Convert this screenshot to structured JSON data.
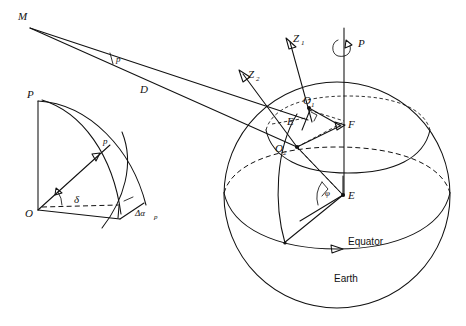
{
  "figure": {
    "background_color": "#ffffff",
    "ink_color": "#111111",
    "width": 466,
    "height": 326
  },
  "labels": {
    "celestial_body": "M",
    "parallax_angle": "p",
    "distance": "D",
    "zenith_1": "Z",
    "zenith_1_sub": "1",
    "zenith_2": "Z",
    "zenith_2_sub": "2",
    "pole": "P",
    "observer_1": "O",
    "observer_1_sub": "1",
    "observer_2": "O",
    "observer_2_sub": "2",
    "earth_centre_upper": "E",
    "foot_point": "F",
    "earth_centre_lower": "E",
    "latitude_angle": "φ",
    "equator": "Equator",
    "earth": "Earth"
  },
  "inset": {
    "pole": "P",
    "origin": "O",
    "arc_parallax": "p",
    "declination": "δ",
    "right_ascension_correction": "Δα",
    "right_ascension_sub": "p"
  },
  "elements": {
    "sphere_name": "earth-sphere",
    "equator_name": "equator-circle",
    "parallel_name": "parallel-circle",
    "axis_name": "polar-axis",
    "rotation_arrow": "rotation-direction-arrow",
    "sight_line_upper": "line-of-sight-o1",
    "sight_line_lower": "line-of-sight-o2"
  }
}
